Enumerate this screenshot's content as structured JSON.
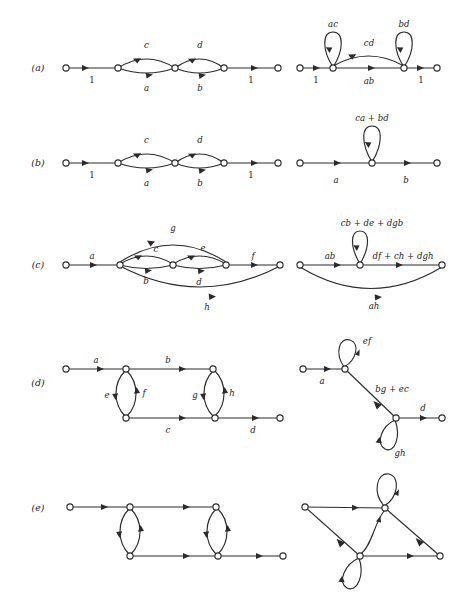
{
  "figure": {
    "rows": [
      {
        "id": "row-a",
        "label": "(a)",
        "left": {
          "name": "original-graph-a",
          "edge_labels": [
            "1",
            "c",
            "a",
            "d",
            "b",
            "1"
          ]
        },
        "right": {
          "name": "reduced-graph-a",
          "edge_labels": [
            "1",
            "ac",
            "cd",
            "ab",
            "bd",
            "1"
          ]
        }
      },
      {
        "id": "row-b",
        "label": "(b)",
        "left": {
          "name": "original-graph-b",
          "edge_labels": [
            "1",
            "c",
            "a",
            "d",
            "b",
            "1"
          ]
        },
        "right": {
          "name": "reduced-graph-b",
          "edge_labels": [
            "a",
            "ca + bd",
            "b"
          ]
        }
      },
      {
        "id": "row-c",
        "label": "(c)",
        "left": {
          "name": "original-graph-c",
          "edge_labels": [
            "a",
            "g",
            "c",
            "e",
            "b",
            "d",
            "f",
            "h"
          ]
        },
        "right": {
          "name": "reduced-graph-c",
          "edge_labels": [
            "ab",
            "cb + de + dgb",
            "df + ch + dgh",
            "ah"
          ]
        }
      },
      {
        "id": "row-d",
        "label": "(d)",
        "left": {
          "name": "original-graph-d",
          "edge_labels": [
            "a",
            "b",
            "e",
            "f",
            "g",
            "h",
            "c",
            "d"
          ]
        },
        "right": {
          "name": "reduced-graph-d",
          "edge_labels": [
            "a",
            "ef",
            "bg + ec",
            "gh",
            "d"
          ]
        }
      },
      {
        "id": "row-e",
        "label": "(e)",
        "left": {
          "name": "original-graph-e",
          "edge_labels": []
        },
        "right": {
          "name": "reduced-graph-e",
          "edge_labels": []
        }
      }
    ],
    "colors": {
      "ink": "#2b2b2b",
      "text": "#1a1a1a",
      "background": "#ffffff",
      "node_fill": "#ffffff"
    }
  }
}
